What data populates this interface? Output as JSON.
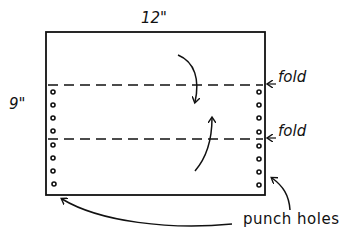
{
  "diagram": {
    "dimensions": {
      "width_label": "12\"",
      "height_label": "9\""
    },
    "fold_lines": [
      {
        "label": "fold",
        "y": 85
      },
      {
        "label": "fold",
        "y": 139
      }
    ],
    "punch_holes_label": "punch holes",
    "colors": {
      "ink": "#111111",
      "background": "#ffffff"
    }
  }
}
